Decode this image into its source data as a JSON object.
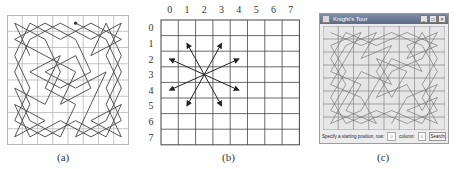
{
  "figure": {
    "panels": [
      {
        "id": "a",
        "caption": "(a)",
        "description": "A complete knight's tour on an 8x8 board drawn as a continuous path"
      },
      {
        "id": "b",
        "caption": "(b)",
        "description": "Possible knight moves from square (3,2)"
      },
      {
        "id": "c",
        "caption": "(c)",
        "description": "Knight's Tour GUI application"
      }
    ]
  },
  "panel_b": {
    "column_labels": [
      "0",
      "1",
      "2",
      "3",
      "4",
      "5",
      "6",
      "7"
    ],
    "row_labels": [
      "0",
      "1",
      "2",
      "3",
      "4",
      "5",
      "6",
      "7"
    ],
    "knight_position": {
      "row": 3,
      "col": 2
    },
    "moves": [
      [
        1,
        1
      ],
      [
        1,
        3
      ],
      [
        2,
        0
      ],
      [
        2,
        4
      ],
      [
        4,
        0
      ],
      [
        4,
        4
      ],
      [
        5,
        1
      ],
      [
        5,
        3
      ]
    ]
  },
  "panel_c": {
    "window_title": "Knight's Tour",
    "window_buttons": [
      "_",
      "□",
      "×"
    ],
    "prompt_label": "Specify a starting position, row:",
    "row_value": "0",
    "column_label": "column:",
    "column_value": "0",
    "search_button": "Search"
  },
  "colors": {
    "grid_light": "#b8b8b8",
    "grid_dark": "#444444",
    "path": "#555555",
    "window_bg": "#ececec",
    "titlebar": "#6a7a96"
  }
}
